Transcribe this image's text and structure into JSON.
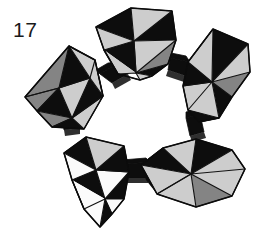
{
  "figure": {
    "number": "17",
    "caption": "17",
    "background_color": "#ffffff"
  },
  "palette": {
    "black": "#0d0d0d",
    "gray": "#848484",
    "light_gray": "#cdcdcd",
    "white": "#fbfbfb",
    "edge": "#111111",
    "caption_color": "#1a1a1a"
  },
  "scene": {
    "shape_count": 5,
    "connector_count": 5,
    "arrangement": "cyclic-ring",
    "units": [
      {
        "id": "unit-top",
        "name": "polyhedron-top",
        "position": "top-center",
        "center": {
          "x": 133,
          "y": 41
        },
        "face_colors": [
          "black",
          "light_gray",
          "black",
          "light_gray",
          "gray",
          "black"
        ]
      },
      {
        "id": "unit-top-right",
        "name": "polyhedron-top-right",
        "position": "right",
        "center": {
          "x": 212,
          "y": 79
        },
        "face_colors": [
          "black",
          "light_gray",
          "gray",
          "black",
          "light_gray",
          "black"
        ]
      },
      {
        "id": "unit-bottom-right",
        "name": "polyhedron-bottom-right",
        "position": "bottom-right",
        "center": {
          "x": 192,
          "y": 176
        },
        "face_colors": [
          "light_gray",
          "black",
          "light_gray",
          "black",
          "gray",
          "light_gray"
        ]
      },
      {
        "id": "unit-bottom-left",
        "name": "polyhedron-bottom-left",
        "position": "bottom-left",
        "center": {
          "x": 95,
          "y": 180
        },
        "face_colors": [
          "black",
          "light_gray",
          "white",
          "black",
          "white",
          "black"
        ]
      },
      {
        "id": "unit-left",
        "name": "polyhedron-left",
        "position": "left",
        "center": {
          "x": 58,
          "y": 88
        },
        "face_colors": [
          "gray",
          "black",
          "light_gray",
          "black",
          "gray",
          "light_gray"
        ]
      }
    ],
    "connectors": [
      {
        "id": "conn-left-top",
        "name": "connector-left-to-top",
        "from": "unit-left",
        "to": "unit-top"
      },
      {
        "id": "conn-top-right",
        "name": "connector-top-to-top-right",
        "from": "unit-top",
        "to": "unit-top-right"
      },
      {
        "id": "conn-right-bottom",
        "name": "connector-top-right-to-bottom",
        "from": "unit-top-right",
        "to": "unit-bottom-right"
      },
      {
        "id": "conn-bottom",
        "name": "connector-bottom-right-to-left",
        "from": "unit-bottom-right",
        "to": "unit-bottom-left"
      },
      {
        "id": "conn-bl-left",
        "name": "connector-bottom-left-to-left",
        "from": "unit-bottom-left",
        "to": "unit-left"
      }
    ]
  }
}
